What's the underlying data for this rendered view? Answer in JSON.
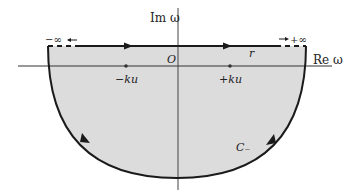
{
  "diagram": {
    "axes": {
      "imag_label": "Im ω",
      "real_label": "Re ω",
      "origin_label": "O"
    },
    "points": [
      {
        "label": "−ku",
        "x": 126
      },
      {
        "label": "+ku",
        "x": 230
      }
    ],
    "contour": {
      "path_label": "r",
      "arc_label": "C₋",
      "left_end_label": "−∞",
      "right_end_label": "+∞"
    },
    "colors": {
      "fill": "#d9d9d9",
      "stroke": "#1a1a1a",
      "axis": "#333333",
      "background": "#ffffff"
    }
  }
}
